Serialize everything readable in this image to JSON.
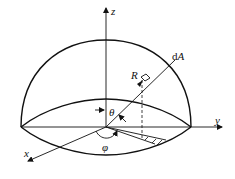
{
  "diagram": {
    "labels": {
      "z_axis": "z",
      "y_axis": "y",
      "x_axis": "x",
      "radius": "R",
      "area_element": "dA",
      "polar_angle": "θ",
      "azimuth_angle": "φ"
    },
    "colors": {
      "stroke": "#111111",
      "background": "#ffffff"
    }
  }
}
